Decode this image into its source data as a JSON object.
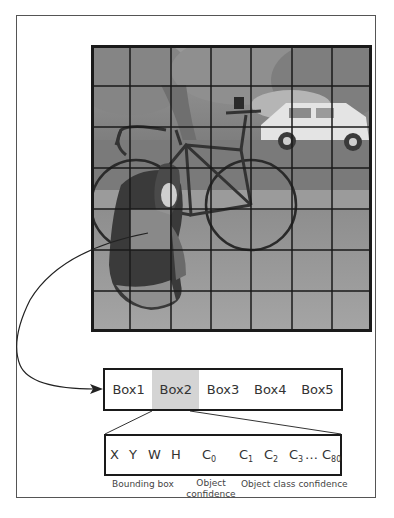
{
  "figure": {
    "grid": {
      "rows": 7,
      "cols": 7,
      "highlighted_cell": {
        "row": 4,
        "col": 1
      }
    },
    "photo_content": [
      "trees",
      "white pickup truck",
      "road bicycle",
      "dog sitting"
    ],
    "colors": {
      "frame": "#555555",
      "grid_lines": "#1a1a1a",
      "highlight_fill": "#d4d4d4",
      "arrow": "#222222"
    }
  },
  "boxes": {
    "items": [
      {
        "label": "Box1",
        "highlighted": false
      },
      {
        "label": "Box2",
        "highlighted": true
      },
      {
        "label": "Box3",
        "highlighted": false
      },
      {
        "label": "Box4",
        "highlighted": false
      },
      {
        "label": "Box5",
        "highlighted": false
      }
    ]
  },
  "vector": {
    "x": "X",
    "y": "Y",
    "w": "W",
    "h": "H",
    "c0": {
      "base": "C",
      "sub": "0"
    },
    "c1": {
      "base": "C",
      "sub": "1"
    },
    "c2": {
      "base": "C",
      "sub": "2"
    },
    "c3": {
      "base": "C",
      "sub": "3"
    },
    "ellipsis": "…",
    "c80": {
      "base": "C",
      "sub": "80"
    }
  },
  "labels": {
    "bounding_box": "Bounding box",
    "object_confidence_1": "Object",
    "object_confidence_2": "confidence",
    "class_confidence": "Object class confidence"
  }
}
